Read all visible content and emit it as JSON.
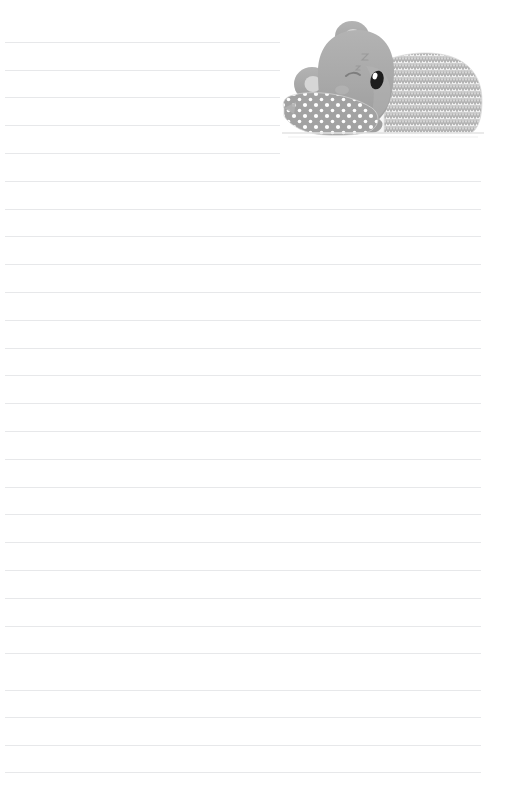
{
  "page": {
    "kind": "lined-notepaper",
    "width": 518,
    "height": 807,
    "background_color": "#ffffff",
    "orientation": "portrait",
    "title_text": "",
    "header_text": "",
    "footer_text": "",
    "body_text": ""
  },
  "ruled_lines": {
    "count": 27,
    "color": "#e7e8ea",
    "thickness_px": 1,
    "spacing_px": 27.7,
    "first_y": 42,
    "margin_left_px": 5,
    "margin_right_px": 481,
    "truncated_right_px": 280,
    "truncated_line_indices": [
      0,
      1,
      2,
      3,
      4
    ],
    "y_positions": [
      42,
      70,
      97,
      125,
      153,
      181,
      209,
      236,
      264,
      292,
      320,
      348,
      375,
      403,
      431,
      459,
      487,
      514,
      542,
      570,
      598,
      626,
      653,
      690,
      717,
      745,
      772
    ]
  },
  "illustration": {
    "name": "sleeping-koala-in-bed",
    "description": "Grey cartoon koala asleep in bed with a polka-dot pillow and a chevron-patterned blanket",
    "x": 280,
    "y": 14,
    "width": 211,
    "height": 130,
    "colors": {
      "koala_body": "#a9a9a9",
      "koala_shade": "#9b9b9b",
      "ear_inner": "#d3d3d3",
      "nose": "#1f1f1f",
      "nose_highlight": "#ffffff",
      "pillow": "#a0a0a0",
      "pillow_dots": "#ffffff",
      "sheet": "#f2f2f2",
      "sheet_edge": "#e0e0e0",
      "blanket_base": "#efefef",
      "blanket_chevron": "#b4b4b4",
      "outline": "#d8d8d8"
    },
    "parts": [
      {
        "name": "blanket",
        "pattern": "chevron"
      },
      {
        "name": "sheet-fold",
        "pattern": "solid"
      },
      {
        "name": "pillow",
        "pattern": "polka-dot"
      },
      {
        "name": "koala-head",
        "pattern": "solid"
      },
      {
        "name": "koala-ear-top",
        "pattern": "solid"
      },
      {
        "name": "koala-ear-side",
        "pattern": "solid"
      },
      {
        "name": "koala-nose",
        "pattern": "solid"
      },
      {
        "name": "koala-eye-closed",
        "pattern": "line"
      },
      {
        "name": "koala-arm",
        "pattern": "solid"
      }
    ]
  }
}
